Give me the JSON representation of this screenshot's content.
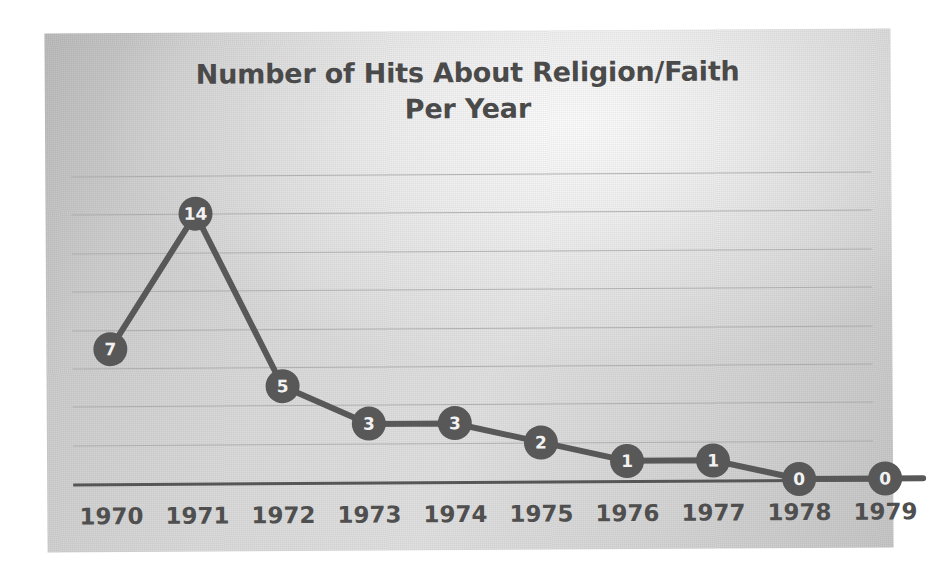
{
  "chart_data": {
    "type": "line",
    "title": "Number of Hits About Religion/Faith\nPer Year",
    "xlabel": "",
    "ylabel": "",
    "categories": [
      "1970",
      "1971",
      "1972",
      "1973",
      "1974",
      "1975",
      "1976",
      "1977",
      "1978",
      "1979"
    ],
    "values": [
      7,
      14,
      5,
      3,
      3,
      2,
      1,
      1,
      0,
      0
    ],
    "data_labels": [
      "7",
      "14",
      "5",
      "3",
      "3",
      "2",
      "1",
      "1",
      "0",
      "0"
    ],
    "ylim": [
      0,
      16
    ],
    "y_gridlines": [
      2,
      4,
      6,
      8,
      10,
      12,
      14,
      16
    ],
    "y_tick_labels_visible": false,
    "grid": true,
    "legend": false,
    "legend_position": "none",
    "series": [
      {
        "name": "Hits",
        "values": [
          7,
          14,
          5,
          3,
          3,
          2,
          1,
          1,
          0,
          0
        ],
        "marker": "circle-filled",
        "marker_color": "#585858",
        "line_color": "#585858",
        "label_color": "#f2f2f2"
      }
    ],
    "colors": {
      "series": "#585858",
      "axis": "#565656",
      "gridline": "#a8a8a8",
      "title_text": "#4a4a4a",
      "tick_text": "#4f4f4f",
      "plot_background": "#d8d8d8",
      "page_background": "#ffffff"
    }
  }
}
